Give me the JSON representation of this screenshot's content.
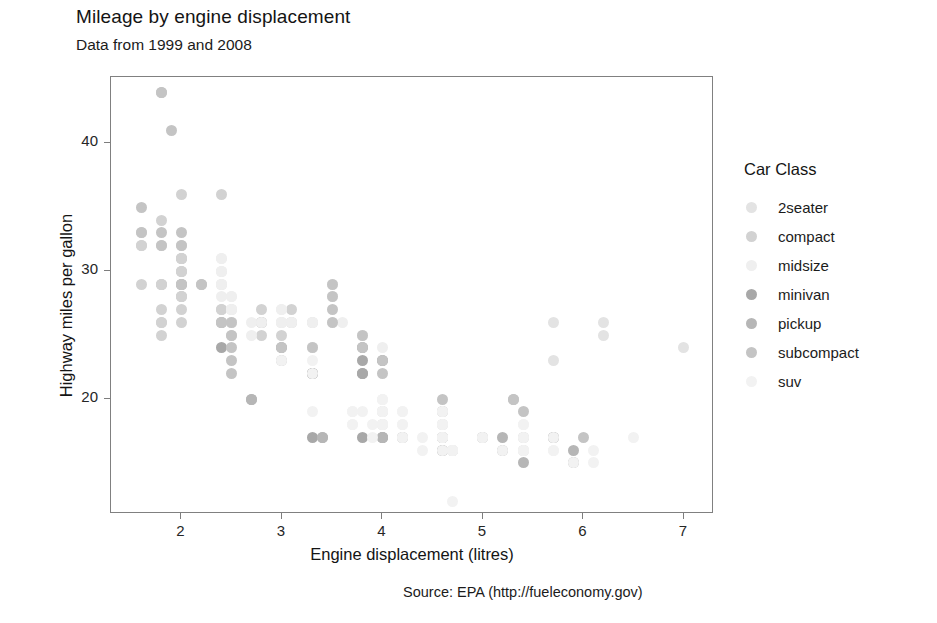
{
  "chart_data": {
    "type": "scatter",
    "title": "Mileage by engine displacement",
    "subtitle": "Data from 1999 and 2008",
    "caption": "Source: EPA (http://fueleconomy.gov)",
    "xlabel": "Engine displacement (litres)",
    "ylabel": "Highway miles per gallon",
    "legend_title": "Car Class",
    "legend_position": "right",
    "grid": false,
    "xlim": [
      1.3,
      7.3
    ],
    "ylim": [
      11.0,
      45.2
    ],
    "xticks": [
      2,
      3,
      4,
      5,
      6,
      7
    ],
    "yticks": [
      20,
      30,
      40
    ],
    "xtick_labels": [
      "2",
      "3",
      "4",
      "5",
      "6",
      "7"
    ],
    "ytick_labels": [
      "20",
      "30",
      "40"
    ],
    "colors": {
      "2seater": "#e3e3e3",
      "compact": "#d2d2d2",
      "midsize": "#efefef",
      "minivan": "#a8a8a8",
      "pickup": "#b6b6b6",
      "subcompact": "#c4c4c4",
      "suv": "#f2f2f2",
      "panel_border": "#808080",
      "axis_text": "#262626",
      "title_text": "#141414"
    },
    "series": [
      {
        "name": "2seater",
        "color": "#e3e3e3",
        "points": [
          [
            5.7,
            26
          ],
          [
            5.7,
            23
          ],
          [
            6.2,
            26
          ],
          [
            6.2,
            25
          ],
          [
            7.0,
            24
          ]
        ]
      },
      {
        "name": "compact",
        "color": "#d2d2d2",
        "points": [
          [
            1.8,
            29
          ],
          [
            1.8,
            29
          ],
          [
            2.0,
            31
          ],
          [
            2.0,
            30
          ],
          [
            2.8,
            26
          ],
          [
            2.8,
            26
          ],
          [
            3.1,
            27
          ],
          [
            1.8,
            26
          ],
          [
            1.8,
            25
          ],
          [
            2.0,
            28
          ],
          [
            2.0,
            27
          ],
          [
            2.8,
            25
          ],
          [
            1.8,
            29
          ],
          [
            2.0,
            31
          ],
          [
            2.0,
            32
          ],
          [
            2.8,
            27
          ],
          [
            2.8,
            26
          ],
          [
            3.1,
            26
          ],
          [
            1.8,
            26
          ],
          [
            1.8,
            27
          ],
          [
            2.0,
            30
          ],
          [
            2.0,
            31
          ],
          [
            2.8,
            26
          ],
          [
            3.1,
            26
          ],
          [
            2.4,
            27
          ],
          [
            2.4,
            26
          ],
          [
            2.5,
            26
          ],
          [
            2.5,
            25
          ],
          [
            3.3,
            24
          ],
          [
            2.0,
            28
          ],
          [
            2.0,
            29
          ],
          [
            2.4,
            27
          ],
          [
            2.4,
            26
          ],
          [
            3.0,
            26
          ],
          [
            3.0,
            25
          ],
          [
            2.0,
            30
          ],
          [
            2.0,
            31
          ],
          [
            2.5,
            27
          ],
          [
            2.5,
            26
          ],
          [
            3.3,
            26
          ],
          [
            1.6,
            33
          ],
          [
            1.6,
            32
          ],
          [
            1.6,
            32
          ],
          [
            1.6,
            29
          ],
          [
            1.8,
            32
          ],
          [
            1.8,
            34
          ],
          [
            2.0,
            36
          ],
          [
            2.4,
            36
          ],
          [
            2.4,
            29
          ],
          [
            2.0,
            28
          ],
          [
            2.0,
            26
          ],
          [
            2.4,
            26
          ]
        ]
      },
      {
        "name": "midsize",
        "color": "#efefef",
        "points": [
          [
            2.4,
            31
          ],
          [
            2.4,
            30
          ],
          [
            3.1,
            26
          ],
          [
            3.5,
            28
          ],
          [
            2.4,
            31
          ],
          [
            2.4,
            30
          ],
          [
            3.0,
            26
          ],
          [
            3.0,
            27
          ],
          [
            3.5,
            29
          ],
          [
            2.4,
            30
          ],
          [
            2.4,
            29
          ],
          [
            3.1,
            26
          ],
          [
            3.6,
            26
          ],
          [
            2.4,
            28
          ],
          [
            2.4,
            29
          ],
          [
            3.0,
            26
          ],
          [
            3.3,
            26
          ],
          [
            2.5,
            27
          ],
          [
            2.5,
            28
          ],
          [
            2.8,
            26
          ],
          [
            3.5,
            29
          ],
          [
            2.5,
            27
          ],
          [
            2.5,
            28
          ],
          [
            3.0,
            26
          ],
          [
            3.5,
            28
          ],
          [
            2.4,
            29
          ],
          [
            2.4,
            30
          ],
          [
            3.0,
            26
          ],
          [
            3.0,
            27
          ],
          [
            3.3,
            26
          ],
          [
            3.8,
            25
          ],
          [
            4.0,
            24
          ],
          [
            2.5,
            27
          ],
          [
            2.5,
            26
          ],
          [
            3.5,
            26
          ],
          [
            3.8,
            25
          ],
          [
            2.7,
            26
          ],
          [
            2.7,
            25
          ],
          [
            3.3,
            24
          ],
          [
            3.8,
            25
          ],
          [
            4.0,
            23
          ]
        ]
      },
      {
        "name": "minivan",
        "color": "#a8a8a8",
        "points": [
          [
            2.4,
            24
          ],
          [
            3.0,
            24
          ],
          [
            3.3,
            22
          ],
          [
            3.3,
            22
          ],
          [
            3.8,
            24
          ],
          [
            3.8,
            22
          ],
          [
            3.8,
            23
          ],
          [
            4.0,
            23
          ],
          [
            3.3,
            22
          ],
          [
            3.8,
            22
          ],
          [
            3.3,
            17
          ],
          [
            3.8,
            17
          ]
        ]
      },
      {
        "name": "pickup",
        "color": "#b6b6b6",
        "points": [
          [
            2.7,
            20
          ],
          [
            2.7,
            20
          ],
          [
            3.4,
            17
          ],
          [
            3.4,
            17
          ],
          [
            4.0,
            19
          ],
          [
            4.0,
            18
          ],
          [
            4.0,
            17
          ],
          [
            4.0,
            17
          ],
          [
            4.6,
            19
          ],
          [
            4.6,
            17
          ],
          [
            4.6,
            17
          ],
          [
            5.0,
            17
          ],
          [
            4.2,
            17
          ],
          [
            4.2,
            17
          ],
          [
            4.6,
            16
          ],
          [
            4.6,
            16
          ],
          [
            4.6,
            17
          ],
          [
            5.4,
            16
          ],
          [
            5.4,
            15
          ],
          [
            5.4,
            17
          ],
          [
            4.0,
            17
          ],
          [
            4.0,
            17
          ],
          [
            4.6,
            18
          ],
          [
            4.6,
            17
          ],
          [
            5.0,
            17
          ],
          [
            5.2,
            16
          ],
          [
            5.7,
            17
          ],
          [
            5.9,
            15
          ],
          [
            4.7,
            16
          ],
          [
            4.7,
            16
          ],
          [
            5.2,
            17
          ],
          [
            5.7,
            17
          ],
          [
            5.9,
            16
          ]
        ]
      },
      {
        "name": "subcompact",
        "color": "#c4c4c4",
        "points": [
          [
            1.8,
            44
          ],
          [
            1.8,
            44
          ],
          [
            1.9,
            41
          ],
          [
            2.0,
            29
          ],
          [
            2.0,
            29
          ],
          [
            2.5,
            23
          ],
          [
            2.5,
            22
          ],
          [
            3.3,
            24
          ],
          [
            2.0,
            29
          ],
          [
            2.0,
            29
          ],
          [
            2.5,
            25
          ],
          [
            2.5,
            24
          ],
          [
            3.0,
            23
          ],
          [
            3.0,
            24
          ],
          [
            3.5,
            29
          ],
          [
            3.5,
            28
          ],
          [
            3.8,
            25
          ],
          [
            3.8,
            24
          ],
          [
            4.0,
            23
          ],
          [
            4.0,
            22
          ],
          [
            4.6,
            20
          ],
          [
            4.6,
            19
          ],
          [
            5.4,
            19
          ],
          [
            1.6,
            35
          ],
          [
            1.6,
            33
          ],
          [
            1.8,
            33
          ],
          [
            1.8,
            32
          ],
          [
            2.0,
            33
          ],
          [
            2.0,
            32
          ],
          [
            2.2,
            29
          ],
          [
            2.2,
            29
          ],
          [
            2.4,
            26
          ],
          [
            2.4,
            26
          ],
          [
            2.5,
            26
          ],
          [
            3.5,
            27
          ],
          [
            3.5,
            26
          ],
          [
            5.3,
            20
          ],
          [
            5.3,
            20
          ],
          [
            5.7,
            17
          ],
          [
            6.0,
            17
          ]
        ]
      },
      {
        "name": "suv",
        "color": "#f2f2f2",
        "points": [
          [
            4.6,
            19
          ],
          [
            5.4,
            18
          ],
          [
            4.0,
            20
          ],
          [
            4.0,
            19
          ],
          [
            4.6,
            17
          ],
          [
            5.0,
            17
          ],
          [
            4.2,
            19
          ],
          [
            4.2,
            18
          ],
          [
            4.4,
            17
          ],
          [
            4.6,
            17
          ],
          [
            5.4,
            16
          ],
          [
            5.4,
            16
          ],
          [
            4.0,
            20
          ],
          [
            4.0,
            19
          ],
          [
            4.7,
            16
          ],
          [
            4.7,
            16
          ],
          [
            4.7,
            16
          ],
          [
            5.7,
            17
          ],
          [
            6.1,
            15
          ],
          [
            4.0,
            19
          ],
          [
            4.0,
            20
          ],
          [
            4.6,
            18
          ],
          [
            5.0,
            17
          ],
          [
            4.2,
            19
          ],
          [
            4.2,
            18
          ],
          [
            4.6,
            17
          ],
          [
            4.6,
            18
          ],
          [
            5.4,
            17
          ],
          [
            3.3,
            19
          ],
          [
            3.8,
            19
          ],
          [
            4.0,
            18
          ],
          [
            4.0,
            18
          ],
          [
            4.6,
            17
          ],
          [
            4.6,
            18
          ],
          [
            5.4,
            17
          ],
          [
            4.2,
            17
          ],
          [
            4.2,
            17
          ],
          [
            4.4,
            16
          ],
          [
            4.6,
            16
          ],
          [
            5.4,
            16
          ],
          [
            3.0,
            23
          ],
          [
            3.3,
            23
          ],
          [
            3.3,
            22
          ],
          [
            3.7,
            18
          ],
          [
            3.7,
            18
          ],
          [
            3.9,
            18
          ],
          [
            3.9,
            17
          ],
          [
            4.7,
            16
          ],
          [
            4.7,
            16
          ],
          [
            4.7,
            16
          ],
          [
            5.2,
            16
          ],
          [
            5.7,
            16
          ],
          [
            5.9,
            15
          ],
          [
            4.6,
            19
          ],
          [
            5.4,
            18
          ],
          [
            4.7,
            12
          ],
          [
            6.5,
            17
          ],
          [
            6.1,
            16
          ],
          [
            5.7,
            16
          ],
          [
            3.7,
            19
          ],
          [
            3.7,
            19
          ],
          [
            4.0,
            18
          ],
          [
            4.0,
            18
          ]
        ]
      }
    ]
  },
  "legend": {
    "title": "Car Class",
    "items": [
      {
        "label": "2seater",
        "color": "#e3e3e3"
      },
      {
        "label": "compact",
        "color": "#d2d2d2"
      },
      {
        "label": "midsize",
        "color": "#efefef"
      },
      {
        "label": "minivan",
        "color": "#a8a8a8"
      },
      {
        "label": "pickup",
        "color": "#b6b6b6"
      },
      {
        "label": "subcompact",
        "color": "#c4c4c4"
      },
      {
        "label": "suv",
        "color": "#f2f2f2"
      }
    ]
  }
}
